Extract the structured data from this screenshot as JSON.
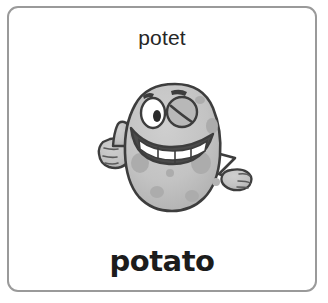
{
  "card": {
    "word_source": "potet",
    "word_target": "potato",
    "border_color": "#9a9a9a",
    "background_color": "#ffffff",
    "text_color": "#262626"
  },
  "illustration": {
    "name": "cartoon-potato-character",
    "body_color": "#c2c2c2",
    "body_shade_color": "#b0b0b0",
    "spot_color": "#a8a8a8",
    "outline_color": "#3d3d3d",
    "highlight_color": "#ffffff",
    "mouth_color": "#4a4a4a",
    "features": [
      "winking-right-eye",
      "open-left-eye",
      "eyebrows",
      "wide-open-smile-with-teeth",
      "thumbs-up-left-hand",
      "open-right-hand"
    ]
  }
}
